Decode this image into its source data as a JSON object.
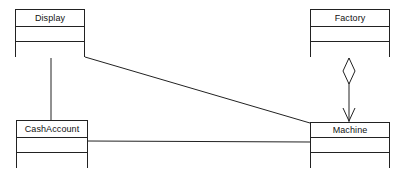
{
  "diagram": {
    "kind": "uml-class-diagram",
    "width": 404,
    "height": 175,
    "background_color": "#ffffff",
    "line_color": "#222222",
    "text_color": "#111111",
    "classes": [
      {
        "id": "display",
        "name": "Display",
        "x": 15,
        "y": 9,
        "width": 70,
        "height": 48,
        "compartments": [
          17,
          15,
          16
        ]
      },
      {
        "id": "factory",
        "name": "Factory",
        "x": 310,
        "y": 9,
        "width": 80,
        "height": 48,
        "compartments": [
          17,
          15,
          16
        ]
      },
      {
        "id": "cashaccount",
        "name": "CashAccount",
        "x": 16,
        "y": 120,
        "width": 72,
        "height": 48,
        "compartments": [
          17,
          15,
          16
        ]
      },
      {
        "id": "machine",
        "name": "Machine",
        "x": 310,
        "y": 122,
        "width": 80,
        "height": 46,
        "compartments": [
          15,
          15,
          16
        ]
      }
    ],
    "connectors": [
      {
        "id": "display-cashaccount",
        "type": "association",
        "from": "display",
        "to": "cashaccount",
        "source_end": "none",
        "target_end": "none",
        "points": [
          [
            51,
            57
          ],
          [
            51,
            120
          ]
        ]
      },
      {
        "id": "display-machine",
        "type": "association",
        "from": "display",
        "to": "machine",
        "source_end": "none",
        "target_end": "none",
        "points": [
          [
            85,
            57
          ],
          [
            310,
            123
          ]
        ]
      },
      {
        "id": "cashaccount-machine",
        "type": "association",
        "from": "cashaccount",
        "to": "machine",
        "source_end": "none",
        "target_end": "none",
        "points": [
          [
            88,
            141
          ],
          [
            310,
            142
          ]
        ]
      },
      {
        "id": "factory-machine",
        "type": "aggregation",
        "from": "factory",
        "to": "machine",
        "source_end": "hollow-diamond",
        "target_end": "open-arrow",
        "points": [
          [
            349,
            57
          ],
          [
            349,
            122
          ]
        ],
        "diamond": {
          "cx": 349,
          "top_y": 58,
          "bottom_y": 84,
          "half_width": 6
        },
        "arrow": {
          "tip_x": 349,
          "tip_y": 121,
          "half_width": 6,
          "length": 13
        }
      }
    ]
  }
}
